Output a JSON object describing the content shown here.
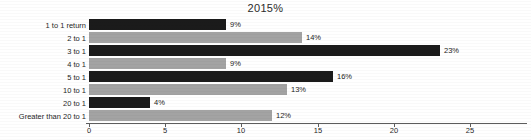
{
  "chart_data": {
    "type": "bar",
    "orientation": "horizontal",
    "title": "2015%",
    "xlabel": "",
    "ylabel": "",
    "xlim": [
      0,
      25
    ],
    "xticks": [
      "0",
      "5",
      "10",
      "15",
      "20",
      "25"
    ],
    "xtick_values": [
      0,
      5,
      10,
      15,
      20,
      25
    ],
    "grid": false,
    "legend": "none",
    "categories": [
      "1 to 1 return",
      "2 to 1",
      "3 to 1",
      "4 to 1",
      "5 to 1",
      "10 to 1",
      "20 to 1",
      "Greater than 20 to 1"
    ],
    "values": [
      9,
      14,
      23,
      9,
      16,
      13,
      4,
      12
    ],
    "data_labels": [
      "9%",
      "14%",
      "23%",
      "9%",
      "16%",
      "13%",
      "4%",
      "12%"
    ],
    "bar_colors": [
      "#1b1b1b",
      "#a3a3a3",
      "#1b1b1b",
      "#a3a3a3",
      "#1b1b1b",
      "#a3a3a3",
      "#1b1b1b",
      "#a3a3a3"
    ],
    "colors": {
      "dark_bar": "#1b1b1b",
      "light_bar": "#a3a3a3",
      "axis": "#5d5d5d",
      "text": "#1a1a1a",
      "background": "#ffffff"
    }
  }
}
